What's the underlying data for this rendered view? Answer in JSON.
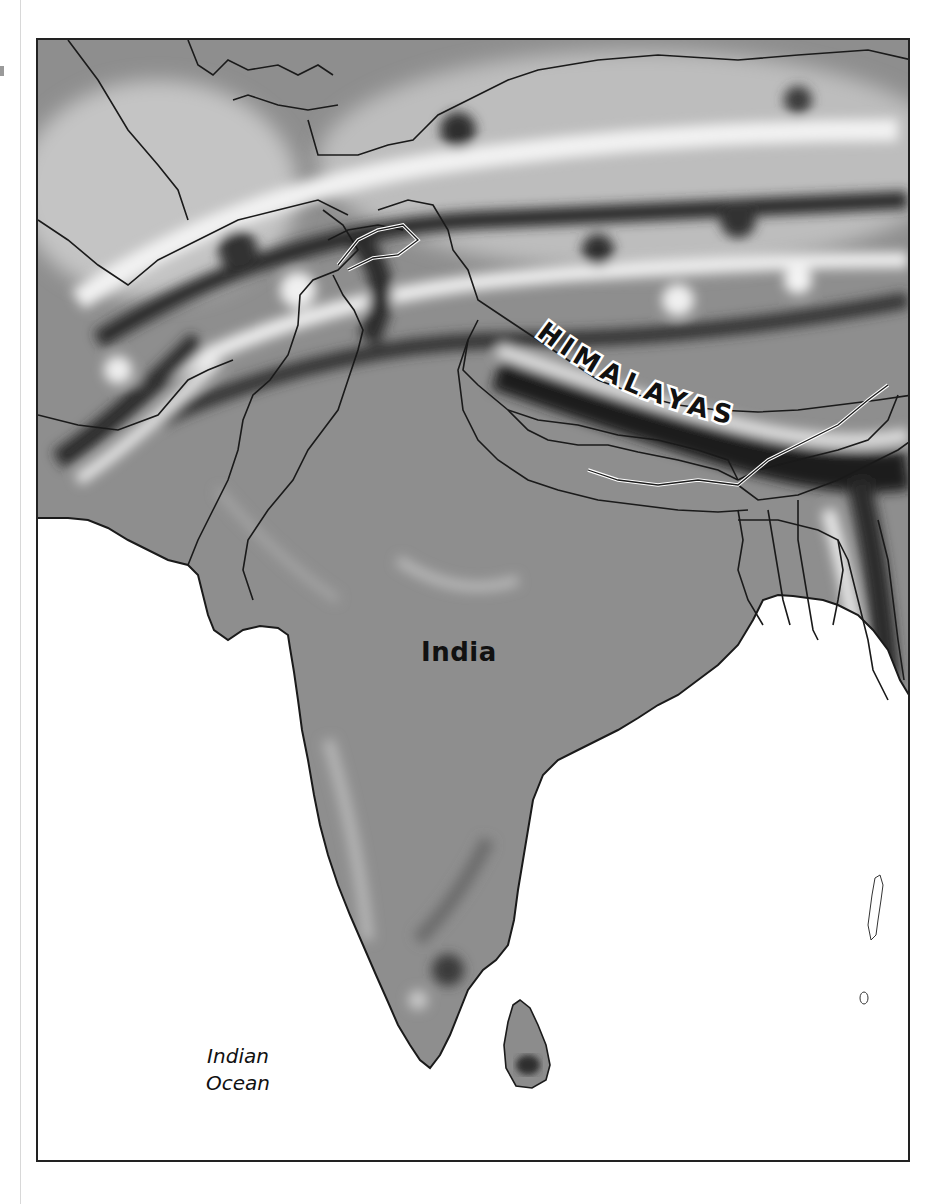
{
  "map": {
    "title": "",
    "labels": {
      "mountain_range": "HIMALAYAS",
      "country": "India",
      "ocean_line1": "Indian",
      "ocean_line2": "Ocean"
    },
    "style": {
      "land_fill": "#8f8f8f",
      "relief_dark": "#2a2a2a",
      "relief_light": "#e8e8e8",
      "ocean_fill": "#ffffff",
      "border_color": "#1a1a1a",
      "frame_color": "#222222"
    },
    "features": [
      "Himalayas",
      "India",
      "Indian Ocean",
      "Sri Lanka",
      "Bay of Bengal coastline",
      "Arabian Sea coastline",
      "Andaman Islands"
    ]
  }
}
